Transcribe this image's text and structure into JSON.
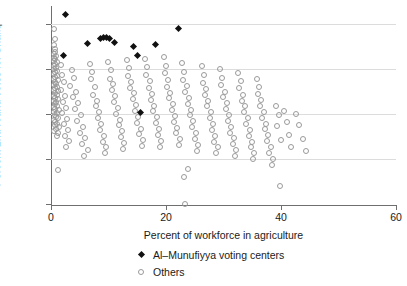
{
  "chart_data": {
    "type": "scatter",
    "title": "",
    "xlabel": "Percent of workforce in agriculture",
    "ylabel": "Percent 2nd round votes for Shafiq",
    "xlim": [
      0,
      60
    ],
    "ylim": [
      0,
      88
    ],
    "xticks": [
      0,
      20,
      40,
      60
    ],
    "yticks": [
      0,
      20,
      40,
      60,
      80
    ],
    "xtick_labels": [
      "0",
      "20",
      "40",
      "60"
    ],
    "ytick_labels": [
      "0",
      "20",
      "40",
      "60",
      "80"
    ],
    "grid": "horizontal",
    "legend_position": "below-axis-center",
    "legend": [
      {
        "name": "Al–Munufiyya voting centers",
        "marker": "filled-diamond",
        "color": "#111111"
      },
      {
        "name": "Others",
        "marker": "open-circle",
        "color": "#9a9a9a"
      }
    ],
    "series": [
      {
        "name": "Al–Munufiyya voting centers",
        "marker": "filled-diamond",
        "color": "#111111",
        "points": [
          [
            2.6,
            84.2
          ],
          [
            2.2,
            65.8
          ],
          [
            6.4,
            71.5
          ],
          [
            8.6,
            73.6
          ],
          [
            9.2,
            73.8
          ],
          [
            9.7,
            73.9
          ],
          [
            10.2,
            73.5
          ],
          [
            11.0,
            72.0
          ],
          [
            14.4,
            69.9
          ],
          [
            15.0,
            65.9
          ],
          [
            15.6,
            40.6
          ],
          [
            18.2,
            70.9
          ],
          [
            22.2,
            77.8
          ]
        ]
      },
      {
        "name": "Others",
        "marker": "open-circle",
        "color": "#9a9a9a",
        "points": [
          [
            0.3,
            78.3
          ],
          [
            0.5,
            74.0
          ],
          [
            0.4,
            71.2
          ],
          [
            0.6,
            69.5
          ],
          [
            0.5,
            68.2
          ],
          [
            0.3,
            67.0
          ],
          [
            0.7,
            66.4
          ],
          [
            0.4,
            65.5
          ],
          [
            0.6,
            64.8
          ],
          [
            0.3,
            64.0
          ],
          [
            0.8,
            63.4
          ],
          [
            0.5,
            62.6
          ],
          [
            0.4,
            61.8
          ],
          [
            0.7,
            61.0
          ],
          [
            0.3,
            60.3
          ],
          [
            0.9,
            59.6
          ],
          [
            0.5,
            58.9
          ],
          [
            0.4,
            58.2
          ],
          [
            0.8,
            57.5
          ],
          [
            0.6,
            56.8
          ],
          [
            0.3,
            56.1
          ],
          [
            1.0,
            55.4
          ],
          [
            0.5,
            54.7
          ],
          [
            0.7,
            54.0
          ],
          [
            0.4,
            53.3
          ],
          [
            0.9,
            52.6
          ],
          [
            0.6,
            51.9
          ],
          [
            0.3,
            51.2
          ],
          [
            1.1,
            50.5
          ],
          [
            0.5,
            49.8
          ],
          [
            0.8,
            49.1
          ],
          [
            0.4,
            48.4
          ],
          [
            0.6,
            47.7
          ],
          [
            1.0,
            47.0
          ],
          [
            0.3,
            46.3
          ],
          [
            0.7,
            45.6
          ],
          [
            0.5,
            44.9
          ],
          [
            0.9,
            44.2
          ],
          [
            0.4,
            43.5
          ],
          [
            0.6,
            42.8
          ],
          [
            1.2,
            42.1
          ],
          [
            0.3,
            41.4
          ],
          [
            0.8,
            40.7
          ],
          [
            0.5,
            40.0
          ],
          [
            0.7,
            39.3
          ],
          [
            1.0,
            38.5
          ],
          [
            0.4,
            37.8
          ],
          [
            0.6,
            37.0
          ],
          [
            0.9,
            36.2
          ],
          [
            0.5,
            35.4
          ],
          [
            1.3,
            34.6
          ],
          [
            0.7,
            33.8
          ],
          [
            0.4,
            32.9
          ],
          [
            1.1,
            31.8
          ],
          [
            0.8,
            30.6
          ],
          [
            1.0,
            15.5
          ],
          [
            1.6,
            62.4
          ],
          [
            1.8,
            58.0
          ],
          [
            2.0,
            54.5
          ],
          [
            1.5,
            51.0
          ],
          [
            2.2,
            48.6
          ],
          [
            1.9,
            46.0
          ],
          [
            2.4,
            43.2
          ],
          [
            1.7,
            41.0
          ],
          [
            2.6,
            38.4
          ],
          [
            2.1,
            36.0
          ],
          [
            2.8,
            33.5
          ],
          [
            2.3,
            30.8
          ],
          [
            3.0,
            28.4
          ],
          [
            2.5,
            26.0
          ],
          [
            3.4,
            60.0
          ],
          [
            3.8,
            56.6
          ],
          [
            3.2,
            53.0
          ],
          [
            4.2,
            50.4
          ],
          [
            3.6,
            47.8
          ],
          [
            4.6,
            45.2
          ],
          [
            4.0,
            42.6
          ],
          [
            5.0,
            40.0
          ],
          [
            4.4,
            37.4
          ],
          [
            5.4,
            34.8
          ],
          [
            4.8,
            32.2
          ],
          [
            5.8,
            29.6
          ],
          [
            5.2,
            27.0
          ],
          [
            6.2,
            24.4
          ],
          [
            5.6,
            21.8
          ],
          [
            6.6,
            62.8
          ],
          [
            7.0,
            59.2
          ],
          [
            6.8,
            55.8
          ],
          [
            7.4,
            52.4
          ],
          [
            7.2,
            49.0
          ],
          [
            7.8,
            46.4
          ],
          [
            7.6,
            43.8
          ],
          [
            8.2,
            41.2
          ],
          [
            8.0,
            38.6
          ],
          [
            8.6,
            36.0
          ],
          [
            8.4,
            33.4
          ],
          [
            9.0,
            30.8
          ],
          [
            8.8,
            28.2
          ],
          [
            9.4,
            25.6
          ],
          [
            9.2,
            23.0
          ],
          [
            9.8,
            63.4
          ],
          [
            10.2,
            59.8
          ],
          [
            10.0,
            56.2
          ],
          [
            10.6,
            53.6
          ],
          [
            10.4,
            51.0
          ],
          [
            11.0,
            48.4
          ],
          [
            10.8,
            45.8
          ],
          [
            11.4,
            43.2
          ],
          [
            11.2,
            40.6
          ],
          [
            11.8,
            38.0
          ],
          [
            11.6,
            35.4
          ],
          [
            12.2,
            32.8
          ],
          [
            12.0,
            30.2
          ],
          [
            12.6,
            27.6
          ],
          [
            12.4,
            25.0
          ],
          [
            13.0,
            64.5
          ],
          [
            13.4,
            61.0
          ],
          [
            13.2,
            57.4
          ],
          [
            13.8,
            54.8
          ],
          [
            13.6,
            52.2
          ],
          [
            14.2,
            49.6
          ],
          [
            14.0,
            47.0
          ],
          [
            14.6,
            44.4
          ],
          [
            14.4,
            41.8
          ],
          [
            15.0,
            39.2
          ],
          [
            14.8,
            36.6
          ],
          [
            15.4,
            34.0
          ],
          [
            15.2,
            31.4
          ],
          [
            15.8,
            28.8
          ],
          [
            15.6,
            26.2
          ],
          [
            16.2,
            65.0
          ],
          [
            16.6,
            61.4
          ],
          [
            16.4,
            58.0
          ],
          [
            17.0,
            55.0
          ],
          [
            16.8,
            52.0
          ],
          [
            17.4,
            49.4
          ],
          [
            17.2,
            46.8
          ],
          [
            17.8,
            44.2
          ],
          [
            17.6,
            41.6
          ],
          [
            18.2,
            39.0
          ],
          [
            18.0,
            36.4
          ],
          [
            18.6,
            33.8
          ],
          [
            18.4,
            31.2
          ],
          [
            19.0,
            28.6
          ],
          [
            18.8,
            26.0
          ],
          [
            19.4,
            66.0
          ],
          [
            19.8,
            62.0
          ],
          [
            19.6,
            58.6
          ],
          [
            20.2,
            55.4
          ],
          [
            20.0,
            52.6
          ],
          [
            20.6,
            50.0
          ],
          [
            20.4,
            47.4
          ],
          [
            21.0,
            44.8
          ],
          [
            20.8,
            42.2
          ],
          [
            21.4,
            39.6
          ],
          [
            21.2,
            37.0
          ],
          [
            21.8,
            34.4
          ],
          [
            21.6,
            31.8
          ],
          [
            22.2,
            29.2
          ],
          [
            22.0,
            26.6
          ],
          [
            22.6,
            63.0
          ],
          [
            23.0,
            59.0
          ],
          [
            22.8,
            55.6
          ],
          [
            23.4,
            52.8
          ],
          [
            23.2,
            50.2
          ],
          [
            23.8,
            47.6
          ],
          [
            23.6,
            45.0
          ],
          [
            24.2,
            42.4
          ],
          [
            24.0,
            39.8
          ],
          [
            24.6,
            37.2
          ],
          [
            24.4,
            34.6
          ],
          [
            25.0,
            32.0
          ],
          [
            24.8,
            29.4
          ],
          [
            25.4,
            26.8
          ],
          [
            25.2,
            24.2
          ],
          [
            23.6,
            16.0
          ],
          [
            23.0,
            12.5
          ],
          [
            23.2,
            0.4
          ],
          [
            26.0,
            61.6
          ],
          [
            26.4,
            57.8
          ],
          [
            26.2,
            54.4
          ],
          [
            26.8,
            51.6
          ],
          [
            26.6,
            49.0
          ],
          [
            27.2,
            46.4
          ],
          [
            27.0,
            43.8
          ],
          [
            27.6,
            41.2
          ],
          [
            27.4,
            38.6
          ],
          [
            28.0,
            36.0
          ],
          [
            27.8,
            33.4
          ],
          [
            28.4,
            30.8
          ],
          [
            28.2,
            28.2
          ],
          [
            28.8,
            25.6
          ],
          [
            28.6,
            23.0
          ],
          [
            29.2,
            60.4
          ],
          [
            29.6,
            56.6
          ],
          [
            29.4,
            53.2
          ],
          [
            30.0,
            50.4
          ],
          [
            29.8,
            47.8
          ],
          [
            30.4,
            45.2
          ],
          [
            30.2,
            42.6
          ],
          [
            30.8,
            40.0
          ],
          [
            30.6,
            37.4
          ],
          [
            31.2,
            34.8
          ],
          [
            31.0,
            32.2
          ],
          [
            31.6,
            29.6
          ],
          [
            31.4,
            27.0
          ],
          [
            32.0,
            24.4
          ],
          [
            31.8,
            21.8
          ],
          [
            32.4,
            58.8
          ],
          [
            32.8,
            55.0
          ],
          [
            32.6,
            51.8
          ],
          [
            33.2,
            49.0
          ],
          [
            33.0,
            46.4
          ],
          [
            33.6,
            43.8
          ],
          [
            33.4,
            41.2
          ],
          [
            34.0,
            38.6
          ],
          [
            33.8,
            36.0
          ],
          [
            34.4,
            33.4
          ],
          [
            34.2,
            30.8
          ],
          [
            34.8,
            28.2
          ],
          [
            34.6,
            25.6
          ],
          [
            35.2,
            23.0
          ],
          [
            35.0,
            20.4
          ],
          [
            35.6,
            56.0
          ],
          [
            36.0,
            52.6
          ],
          [
            35.8,
            49.4
          ],
          [
            36.4,
            46.6
          ],
          [
            36.2,
            44.0
          ],
          [
            36.8,
            41.4
          ],
          [
            36.6,
            38.8
          ],
          [
            37.2,
            36.2
          ],
          [
            37.0,
            33.6
          ],
          [
            37.6,
            31.0
          ],
          [
            37.4,
            28.4
          ],
          [
            38.0,
            25.8
          ],
          [
            37.8,
            23.2
          ],
          [
            38.4,
            20.6
          ],
          [
            38.2,
            18.0
          ],
          [
            39.0,
            44.0
          ],
          [
            39.4,
            40.0
          ],
          [
            39.2,
            35.0
          ],
          [
            39.8,
            29.0
          ],
          [
            39.6,
            8.6
          ],
          [
            40.4,
            42.0
          ],
          [
            40.8,
            37.0
          ],
          [
            41.2,
            31.0
          ],
          [
            41.6,
            26.0
          ],
          [
            42.4,
            40.5
          ],
          [
            43.0,
            35.5
          ],
          [
            43.6,
            29.5
          ],
          [
            44.2,
            24.0
          ]
        ]
      }
    ]
  }
}
